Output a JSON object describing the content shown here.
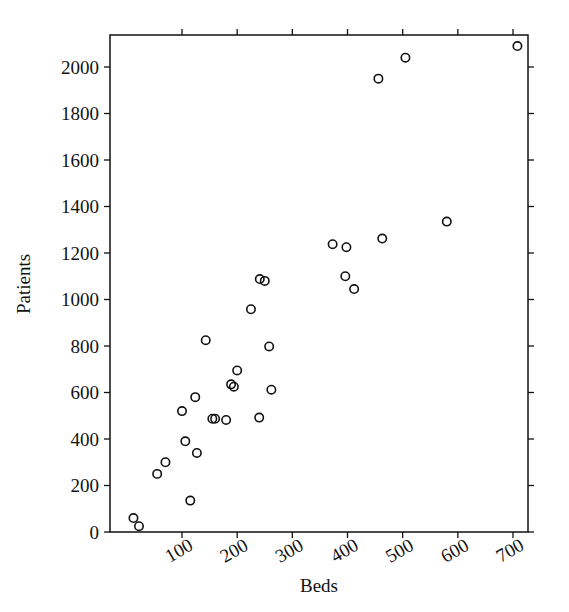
{
  "chart_data": {
    "type": "scatter",
    "title": "",
    "xlabel": "Beds",
    "ylabel": "Patients",
    "xlim": [
      0,
      730
    ],
    "ylim": [
      0,
      2120
    ],
    "grid": false,
    "legend": null,
    "marker": {
      "shape": "open-circle",
      "radius_px": 4.2,
      "stroke": "#111111",
      "fill": "none"
    },
    "axes": {
      "x_ticks": [
        100,
        200,
        300,
        400,
        500,
        600,
        700
      ],
      "x_tick_labels": [
        "100",
        "200",
        "300",
        "400",
        "500",
        "600",
        "700"
      ],
      "x_tick_label_rotation_deg": -30,
      "y_ticks": [
        0,
        200,
        400,
        600,
        800,
        1000,
        1200,
        1400,
        1600,
        1800,
        2000
      ],
      "y_tick_labels": [
        "0",
        "200",
        "400",
        "600",
        "800",
        "1000",
        "1200",
        "1400",
        "1600",
        "1800",
        "2000"
      ],
      "y_tick_label_rotation_deg": 0,
      "frame": "full-box"
    },
    "points": [
      {
        "x": 12,
        "y": 60
      },
      {
        "x": 22,
        "y": 25
      },
      {
        "x": 55,
        "y": 250
      },
      {
        "x": 70,
        "y": 300
      },
      {
        "x": 100,
        "y": 520
      },
      {
        "x": 106,
        "y": 390
      },
      {
        "x": 115,
        "y": 135
      },
      {
        "x": 124,
        "y": 580
      },
      {
        "x": 127,
        "y": 340
      },
      {
        "x": 143,
        "y": 825
      },
      {
        "x": 155,
        "y": 487
      },
      {
        "x": 160,
        "y": 487
      },
      {
        "x": 180,
        "y": 482
      },
      {
        "x": 189,
        "y": 635
      },
      {
        "x": 194,
        "y": 625
      },
      {
        "x": 200,
        "y": 695
      },
      {
        "x": 225,
        "y": 958
      },
      {
        "x": 240,
        "y": 492
      },
      {
        "x": 241,
        "y": 1088
      },
      {
        "x": 250,
        "y": 1080
      },
      {
        "x": 258,
        "y": 798
      },
      {
        "x": 262,
        "y": 612
      },
      {
        "x": 373,
        "y": 1238
      },
      {
        "x": 396,
        "y": 1100
      },
      {
        "x": 398,
        "y": 1225
      },
      {
        "x": 412,
        "y": 1045
      },
      {
        "x": 456,
        "y": 1950
      },
      {
        "x": 463,
        "y": 1262
      },
      {
        "x": 505,
        "y": 2040
      },
      {
        "x": 580,
        "y": 1335
      },
      {
        "x": 708,
        "y": 2090
      }
    ]
  }
}
